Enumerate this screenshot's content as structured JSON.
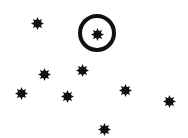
{
  "diagram": {
    "type": "star-field",
    "background": "#ffffff",
    "ink_color": "#111111",
    "star_icon": "eight-point-starburst-icon",
    "stars": [
      {
        "id": "star-1",
        "x": 37,
        "y": 23,
        "highlighted": false
      },
      {
        "id": "star-2",
        "x": 97,
        "y": 34,
        "highlighted": true
      },
      {
        "id": "star-3",
        "x": 44,
        "y": 74,
        "highlighted": false
      },
      {
        "id": "star-4",
        "x": 82,
        "y": 70,
        "highlighted": false
      },
      {
        "id": "star-5",
        "x": 21,
        "y": 93,
        "highlighted": false
      },
      {
        "id": "star-6",
        "x": 67,
        "y": 96,
        "highlighted": false
      },
      {
        "id": "star-7",
        "x": 125,
        "y": 90,
        "highlighted": false
      },
      {
        "id": "star-8",
        "x": 169,
        "y": 101,
        "highlighted": false
      },
      {
        "id": "star-9",
        "x": 104,
        "y": 129,
        "highlighted": false
      }
    ],
    "highlight_ring": {
      "cx": 97,
      "cy": 33,
      "outer_radius": 19,
      "stroke_width": 4,
      "target": "star-2"
    }
  }
}
